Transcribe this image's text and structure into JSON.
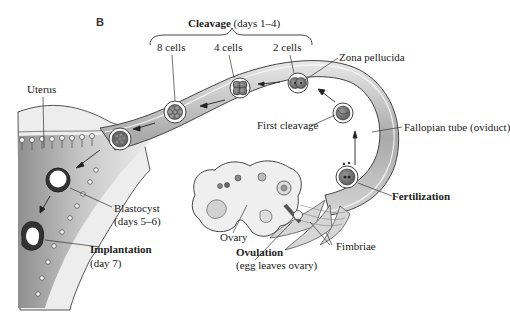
{
  "figure": {
    "panel_letter": "B",
    "title": {
      "bold": "Cleavage",
      "rest": " (days 1–4)"
    },
    "labels": {
      "cells_8": "8 cells",
      "cells_4": "4 cells",
      "cells_2": "2 cells",
      "zona_pellucida": "Zona pellucida",
      "uterus": "Uterus",
      "first_cleavage": "First cleavage",
      "fallopian_tube": "Fallopian tube (oviduct)",
      "fertilization": "Fertilization",
      "blastocyst_line1": "Blastocyst",
      "blastocyst_line2": "(days 5–6)",
      "implantation_line1": "Implantation",
      "implantation_line2": "(day 7)",
      "ovary": "Ovary",
      "ovulation_line1": "Ovulation",
      "ovulation_line2": "(egg leaves ovary)",
      "fimbriae": "Fimbriae"
    },
    "colors": {
      "tube_fill": "#cfcfcf",
      "tube_dark": "#8a8a8a",
      "uterus_fill": "#e6e6e6",
      "cell_fill": "#7a7a7a",
      "outline": "#444444",
      "text": "#222222"
    }
  }
}
